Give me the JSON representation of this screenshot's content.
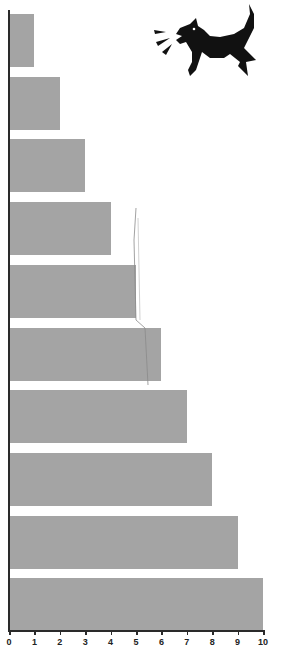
{
  "chart_data": {
    "type": "bar",
    "orientation": "horizontal",
    "title": "",
    "xlabel": "",
    "ylabel": "",
    "categories": [
      "1",
      "2",
      "3",
      "4",
      "5",
      "6",
      "7",
      "8",
      "9",
      "10"
    ],
    "values": [
      1,
      2,
      3,
      4,
      5,
      6,
      7,
      8,
      9,
      10
    ],
    "xlim": [
      0,
      10
    ],
    "x_ticks": [
      "0",
      "1",
      "2",
      "3",
      "4",
      "5",
      "6",
      "7",
      "8",
      "9",
      "10"
    ],
    "grid": false,
    "legend": null,
    "bar_color": "#a4a4a4",
    "annotations": [
      "barking dog illustration (top right)",
      "hand-drawn pencil line near x≈5 spanning bars 4–6"
    ]
  },
  "colors": {
    "bar": "#a4a4a4",
    "axis": "#2a2a2a",
    "illustration": "#111111"
  }
}
